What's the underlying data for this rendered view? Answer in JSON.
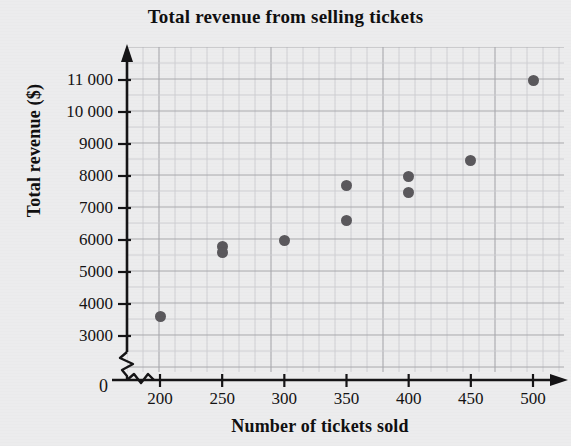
{
  "chart_data": {
    "type": "scatter",
    "title": "Total revenue from selling tickets",
    "xlabel": "Number of tickets sold",
    "ylabel": "Total revenue ($)",
    "xlim": [
      175,
      515
    ],
    "ylim": [
      2600,
      11600
    ],
    "x_ticks": [
      "200",
      "250",
      "300",
      "350",
      "400",
      "450",
      "500"
    ],
    "x_tick_values": [
      200,
      250,
      300,
      350,
      400,
      450,
      500
    ],
    "y_ticks": [
      "3000",
      "4000",
      "5000",
      "6000",
      "7000",
      "8000",
      "9000",
      "10 000",
      "11 000"
    ],
    "y_tick_values": [
      3000,
      4000,
      5000,
      6000,
      7000,
      8000,
      9000,
      10000,
      11000
    ],
    "origin_label": "0",
    "grid": true,
    "axis_break_x": true,
    "axis_break_y": true,
    "legend": "none",
    "marker_color": "#5a585c",
    "axis_color": "#151416",
    "grid_color": "#b9b9bc",
    "background_color": "#ececed",
    "points": [
      {
        "x": 200,
        "y": 3600
      },
      {
        "x": 250,
        "y": 5800
      },
      {
        "x": 250,
        "y": 5600
      },
      {
        "x": 300,
        "y": 6000
      },
      {
        "x": 350,
        "y": 7700
      },
      {
        "x": 350,
        "y": 6600
      },
      {
        "x": 400,
        "y": 8000
      },
      {
        "x": 400,
        "y": 7500
      },
      {
        "x": 450,
        "y": 8500
      },
      {
        "x": 500,
        "y": 11000
      }
    ]
  }
}
